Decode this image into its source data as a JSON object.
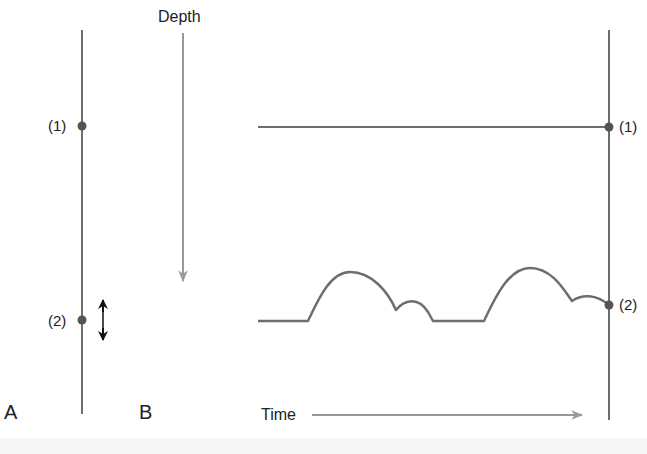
{
  "labels": {
    "depth": "Depth",
    "time": "Time",
    "panel_a": "A",
    "panel_b": "B",
    "point1_left": "(1)",
    "point2_left": "(2)",
    "point1_right": "(1)",
    "point2_right": "(2)"
  },
  "colors": {
    "line": "#6e6e6e",
    "dot": "#555555",
    "arrow_gray": "#999999",
    "arrow_black": "#111111",
    "text": "#222222"
  }
}
